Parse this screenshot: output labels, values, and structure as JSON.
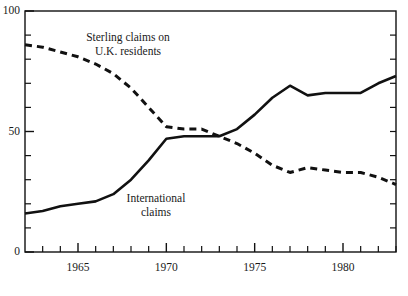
{
  "chart_data": {
    "type": "line",
    "title": "",
    "subtitle": "",
    "xlabel": "",
    "ylabel": "",
    "xlim": [
      1962,
      1983
    ],
    "ylim": [
      0,
      100
    ],
    "grid": false,
    "legend_position": "inline-annotations",
    "y_ticks_major": [
      0,
      50,
      100
    ],
    "y_tick_labels": [
      "0",
      "50",
      "100"
    ],
    "y_ticks_minor": [
      10,
      20,
      30,
      40,
      60,
      70,
      80,
      90
    ],
    "x_ticks_major": [
      1965,
      1970,
      1975,
      1980
    ],
    "x_tick_labels": [
      "1965",
      "1970",
      "1975",
      "1980"
    ],
    "x_ticks_minor": [
      1963,
      1964,
      1966,
      1967,
      1968,
      1969,
      1971,
      1972,
      1973,
      1974,
      1976,
      1977,
      1978,
      1979,
      1981,
      1982,
      1983
    ],
    "x": [
      1962,
      1963,
      1964,
      1965,
      1966,
      1967,
      1968,
      1969,
      1970,
      1971,
      1972,
      1973,
      1974,
      1975,
      1976,
      1977,
      1978,
      1979,
      1980,
      1981,
      1982,
      1983
    ],
    "series": [
      {
        "name": "Sterling claims on U.K. residents",
        "style": "dashed",
        "color": "#111111",
        "label_line_1": "Sterling claims on",
        "label_line_2": "U.K. residents",
        "values": [
          86,
          85,
          83,
          81,
          78,
          74,
          68,
          60,
          52,
          51,
          51,
          48,
          45,
          41,
          36,
          33,
          35,
          34,
          33,
          33,
          31,
          28
        ]
      },
      {
        "name": "International claims",
        "style": "solid",
        "color": "#111111",
        "label_line_1": "International",
        "label_line_2": "claims",
        "values": [
          16,
          17,
          19,
          20,
          21,
          24,
          30,
          38,
          47,
          48,
          48,
          48,
          51,
          57,
          64,
          69,
          65,
          66,
          66,
          66,
          70,
          73
        ]
      }
    ]
  },
  "frame": {
    "color": "#111111"
  }
}
